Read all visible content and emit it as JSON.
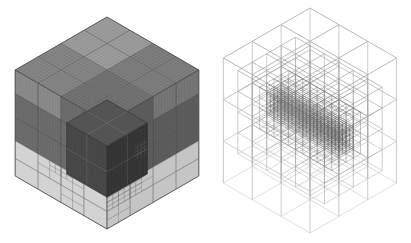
{
  "figure": {
    "background": "#ffffff",
    "width": 411,
    "height": 243,
    "panels": [
      {
        "key": "shaded",
        "label": "shaded-octree-mesh-cube"
      },
      {
        "key": "wireframe",
        "label": "wireframe-octree-mesh-cube"
      }
    ]
  },
  "shaded_cube": {
    "origin_x": 107,
    "origin_y": 17,
    "edge_px": 106,
    "z_scale": 1.0,
    "band_top_z": 0.3333,
    "top_divisions": 4,
    "texture_divisions": 32,
    "dark_row_breaks": [
      0.3333,
      0.5556,
      0.7778,
      1.0
    ],
    "band_row_breaks": [
      0.0,
      0.1667,
      0.3333
    ],
    "face_col_breaks": [
      0.0,
      0.25,
      0.5,
      0.75,
      1.0
    ],
    "colors": {
      "top_back": "#9d9d9d",
      "top_left": "#868686",
      "top_right": "#7e7e7e",
      "top_front": "#737373",
      "left_dark": "#6f6f6f",
      "left_light_block": "#8d8d8d",
      "right_dark": "#5f5f5f",
      "right_light_block": "#787878",
      "band_left": "#d3d3d3",
      "band_right": "#c5c5c5",
      "outline": "#4a4a4a",
      "cell_line_top": "#5a5a5a",
      "cell_line_dark": "#454545",
      "cell_line_band": "#6e6e6e",
      "texture_line": "rgba(0,0,0,0.13)",
      "inner_top": "#525252",
      "inner_left": "#454545",
      "inner_right": "#323232",
      "inner_line": "rgba(200,200,200,0.30)",
      "inner_texture": "rgba(150,150,150,0.22)",
      "inner_outline": "#242424"
    },
    "inner_cube": {
      "x0": 0.56,
      "y0": 0.56,
      "x1": 1.0,
      "y1": 1.0,
      "z0": 0.3,
      "z1": 0.78,
      "major_div": 2,
      "texture_div": 14,
      "sub_cluster": {
        "u0": 0.56,
        "u1": 0.7,
        "z0": 0.5,
        "z1": 0.64,
        "div": 4
      }
    },
    "band_refinements": [
      {
        "face": "left",
        "u0": 0.25,
        "u1": 0.75,
        "z0": 0.1667,
        "z1": 0.3333,
        "nu": 4,
        "nz": 2
      },
      {
        "face": "left",
        "u0": 0.375,
        "u1": 0.625,
        "z0": 0.25,
        "z1": 0.3333,
        "nu": 4,
        "nz": 2
      },
      {
        "face": "left",
        "u0": 0.5,
        "u1": 0.75,
        "z0": 0.0,
        "z1": 0.1667,
        "nu": 2,
        "nz": 2
      },
      {
        "face": "right",
        "u0": 0.5,
        "u1": 1.0,
        "z0": 0.1667,
        "z1": 0.3333,
        "nu": 4,
        "nz": 2
      },
      {
        "face": "right",
        "u0": 0.625,
        "u1": 1.0,
        "z0": 0.1667,
        "z1": 0.3333,
        "nu": 6,
        "nz": 4
      },
      {
        "face": "right",
        "u0": 0.75,
        "u1": 1.0,
        "z0": 0.0,
        "z1": 0.1667,
        "nu": 2,
        "nz": 2
      }
    ]
  },
  "wire_cube": {
    "origin_x": 105,
    "origin_y": 8,
    "edge_px": 100,
    "z_scale": 1.25,
    "levels": [
      {
        "name": "coarse",
        "region": {
          "x0": 0,
          "x1": 1,
          "y0": 0,
          "y1": 1,
          "z0": 0,
          "z1": 1
        },
        "n": [
          3,
          3,
          3
        ],
        "width": 0.7,
        "shade": {
          "base": 0.82,
          "z_gain": 0.22,
          "x_gain": 0.0
        }
      },
      {
        "name": "medium",
        "region": {
          "x0": 0,
          "x1": 1,
          "y0": 0.1667,
          "y1": 0.8333,
          "z0": 0.1667,
          "z1": 0.8333
        },
        "n": [
          6,
          4,
          4
        ],
        "width": 0.55,
        "shade": {
          "base": 0.8,
          "z_gain": 0.3,
          "x_gain": 0.03
        }
      },
      {
        "name": "fine",
        "region": {
          "x0": 0.0833,
          "x1": 0.9167,
          "y0": 0.3333,
          "y1": 0.6667,
          "z0": 0.3333,
          "z1": 0.6667
        },
        "n": [
          10,
          4,
          4
        ],
        "width": 0.45,
        "shade": {
          "base": 0.72,
          "z_gain": 0.34,
          "x_gain": 0.08
        }
      },
      {
        "name": "finest",
        "region": {
          "x0": 0.0833,
          "x1": 0.9167,
          "y0": 0.4167,
          "y1": 0.5833,
          "z0": 0.4167,
          "z1": 0.5833
        },
        "n": [
          20,
          4,
          4
        ],
        "width": 0.4,
        "shade": {
          "base": 0.6,
          "z_gain": 0.26,
          "x_gain": 0.1
        }
      }
    ]
  }
}
